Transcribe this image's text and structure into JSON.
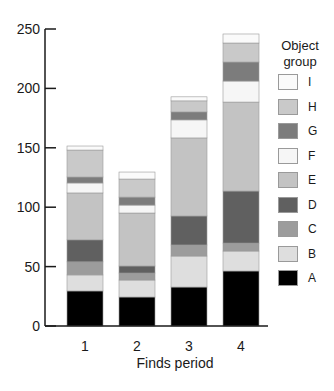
{
  "chart_data": {
    "type": "bar",
    "stacked": true,
    "title": "",
    "xlabel": "Finds period",
    "ylabel": "",
    "ylim": [
      0,
      250
    ],
    "yticks": [
      0,
      50,
      100,
      150,
      200,
      250
    ],
    "grid": false,
    "legend_position": "right",
    "legend_title": "Object group",
    "categories": [
      "1",
      "2",
      "3",
      "4"
    ],
    "series": [
      {
        "name": "A",
        "color": "#000000",
        "values": [
          29.5,
          24.4,
          32.8,
          46.3
        ]
      },
      {
        "name": "B",
        "color": "#dedede",
        "values": [
          13.5,
          14.3,
          26.1,
          16.8
        ]
      },
      {
        "name": "C",
        "color": "#9c9c9c",
        "values": [
          11.0,
          5.9,
          9.3,
          6.7
        ]
      },
      {
        "name": "D",
        "color": "#606060",
        "values": [
          18.5,
          5.9,
          24.4,
          43.8
        ]
      },
      {
        "name": "E",
        "color": "#c3c3c3",
        "values": [
          39.5,
          44.6,
          65.7,
          74.9
        ]
      },
      {
        "name": "F",
        "color": "#f6f6f6",
        "values": [
          8.4,
          6.7,
          15.2,
          17.7
        ]
      },
      {
        "name": "G",
        "color": "#7c7c7c",
        "values": [
          5.0,
          6.7,
          6.7,
          16.0
        ]
      },
      {
        "name": "H",
        "color": "#c9c9c9",
        "values": [
          22.7,
          15.2,
          9.3,
          16.0
        ]
      },
      {
        "name": "I",
        "color": "#fafafa",
        "values": [
          3.4,
          5.9,
          3.4,
          7.6
        ]
      }
    ],
    "totals": [
      151.5,
      129.6,
      192.9,
      245.8
    ]
  },
  "legend": {
    "title_line1": "Object",
    "title_line2": "group",
    "order": [
      "I",
      "H",
      "G",
      "F",
      "E",
      "D",
      "C",
      "B",
      "A"
    ]
  },
  "axis": {
    "y_tick_labels": [
      "0",
      "50",
      "100",
      "150",
      "200",
      "250"
    ],
    "x_tick_labels": [
      "1",
      "2",
      "3",
      "4"
    ],
    "x_title": "Finds period"
  }
}
